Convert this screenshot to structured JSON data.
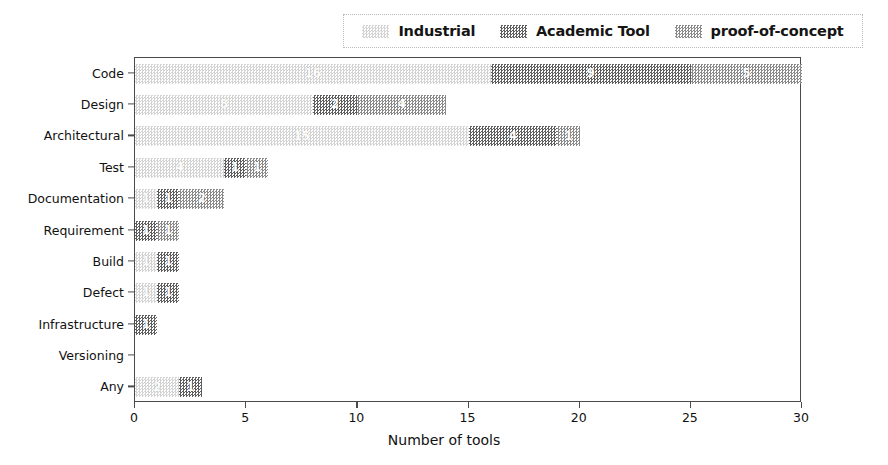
{
  "chart_data": {
    "type": "bar",
    "orientation": "horizontal",
    "stacked": true,
    "title": "",
    "xlabel": "Number of tools",
    "ylabel": "",
    "xlim": [
      0,
      30
    ],
    "xticks": [
      0,
      5,
      10,
      15,
      20,
      25,
      30
    ],
    "grid": false,
    "legend_position": "top",
    "categories": [
      "Code",
      "Design",
      "Architectural",
      "Test",
      "Documentation",
      "Requirement",
      "Build",
      "Defect",
      "Infrastructure",
      "Versioning",
      "Any"
    ],
    "series": [
      {
        "name": "Industrial",
        "color": "#d4d4d4",
        "values": [
          16,
          8,
          15,
          4,
          1,
          0,
          1,
          1,
          0,
          0,
          2
        ]
      },
      {
        "name": "Academic Tool",
        "color": "#5e5e5e",
        "values": [
          9,
          2,
          4,
          1,
          1,
          1,
          1,
          1,
          1,
          0,
          1
        ]
      },
      {
        "name": "proof-of-concept",
        "color": "#8a8a8a",
        "values": [
          5,
          4,
          1,
          1,
          2,
          1,
          0,
          0,
          0,
          0,
          0
        ]
      }
    ],
    "totals": [
      30,
      14,
      20,
      6,
      4,
      2,
      2,
      2,
      1,
      0,
      3
    ]
  },
  "legend": {
    "entries": [
      {
        "label": "Industrial"
      },
      {
        "label": "Academic Tool"
      },
      {
        "label": "proof-of-concept"
      }
    ]
  },
  "axes": {
    "x_title": "Number of tools",
    "x_tick_labels": [
      "0",
      "5",
      "10",
      "15",
      "20",
      "25",
      "30"
    ],
    "y_tick_labels": [
      "Code",
      "Design",
      "Architectural",
      "Test",
      "Documentation",
      "Requirement",
      "Build",
      "Defect",
      "Infrastructure",
      "Versioning",
      "Any"
    ]
  }
}
